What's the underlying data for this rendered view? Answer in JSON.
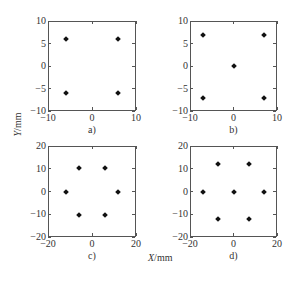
{
  "chart_data": [
    {
      "type": "scatter",
      "panel_label": "a)",
      "xlim": [
        -10,
        10
      ],
      "ylim": [
        -10,
        10
      ],
      "xticks": [
        -10,
        0,
        10
      ],
      "yticks": [
        -10,
        -5,
        0,
        5,
        10
      ],
      "points": [
        [
          -6,
          6
        ],
        [
          6,
          6
        ],
        [
          -6,
          -6
        ],
        [
          6,
          -6
        ]
      ],
      "box": {
        "left": 48,
        "top": 21,
        "width": 88,
        "height": 90
      }
    },
    {
      "type": "scatter",
      "panel_label": "b)",
      "xlim": [
        -10,
        10
      ],
      "ylim": [
        -10,
        10
      ],
      "xticks": [
        -10,
        0,
        10
      ],
      "yticks": [
        -10,
        -5,
        0,
        5,
        10
      ],
      "points": [
        [
          -7,
          7
        ],
        [
          7,
          7
        ],
        [
          0,
          0
        ],
        [
          -7,
          -7
        ],
        [
          7,
          -7
        ]
      ],
      "box": {
        "left": 190,
        "top": 21,
        "width": 87,
        "height": 90
      }
    },
    {
      "type": "scatter",
      "panel_label": "c)",
      "xlim": [
        -20,
        20
      ],
      "ylim": [
        -20,
        20
      ],
      "xticks": [
        -20,
        0,
        20
      ],
      "yticks": [
        -20,
        -10,
        0,
        10,
        20
      ],
      "points": [
        [
          -6,
          10.4
        ],
        [
          6,
          10.4
        ],
        [
          -12,
          0
        ],
        [
          12,
          0
        ],
        [
          -6,
          -10.4
        ],
        [
          6,
          -10.4
        ]
      ],
      "box": {
        "left": 48,
        "top": 146,
        "width": 88,
        "height": 91
      }
    },
    {
      "type": "scatter",
      "panel_label": "d)",
      "xlim": [
        -20,
        20
      ],
      "ylim": [
        -20,
        20
      ],
      "xticks": [
        -20,
        0,
        20
      ],
      "yticks": [
        -20,
        -10,
        0,
        10,
        20
      ],
      "points": [
        [
          -7,
          12.1
        ],
        [
          7,
          12.1
        ],
        [
          -14,
          0
        ],
        [
          0,
          0
        ],
        [
          14,
          0
        ],
        [
          -7,
          -12.1
        ],
        [
          7,
          -12.1
        ]
      ],
      "box": {
        "left": 190,
        "top": 146,
        "width": 87,
        "height": 91
      }
    }
  ],
  "labels": {
    "ylabel_var": "Y",
    "ylabel_unit": "/mm",
    "xlabel_var": "X",
    "xlabel_unit": "/mm"
  }
}
